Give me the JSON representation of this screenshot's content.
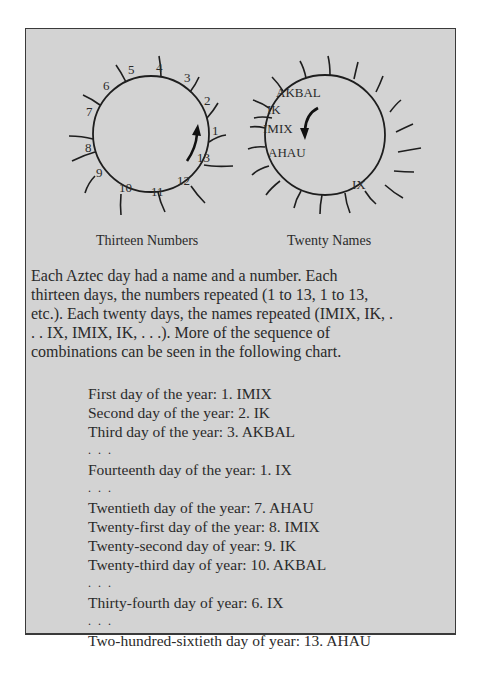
{
  "diagram": {
    "left_wheel": {
      "caption": "Thirteen Numbers",
      "numbers": [
        "1",
        "2",
        "3",
        "4",
        "5",
        "6",
        "7",
        "8",
        "9",
        "10",
        "11",
        "12",
        "13"
      ]
    },
    "right_wheel": {
      "caption": "Twenty Names",
      "names": [
        "AKBAL",
        "IK",
        "IMIX",
        "AHAU",
        "IX"
      ]
    }
  },
  "paragraph": {
    "lines": [
      "Each Aztec day had a name and a number.  Each",
      "thirteen days, the numbers repeated (1 to 13, 1 to 13,",
      "etc.).  Each twenty days, the names repeated (IMIX, IK, .",
      ". . IX, IMIX, IK, . . .).  More of the sequence of",
      "combinations can be seen in the following chart."
    ]
  },
  "chart": {
    "rows": [
      "First day of the year:  1.  IMIX",
      "Second day of the year:  2.  IK",
      "Third day of the year:  3.  AKBAL",
      ". . .",
      "Fourteenth day of the year:  1.  IX",
      ". . .",
      "Twentieth day of the year:  7.  AHAU",
      "Twenty-first day of the year:  8.  IMIX",
      "Twenty-second day of year:  9.  IK",
      "Twenty-third day of year:  10.  AKBAL",
      ". . .",
      "Thirty-fourth day of year:  6.  IX",
      ". . .",
      "Two-hundred-sixtieth day of year:  13.  AHAU"
    ]
  }
}
